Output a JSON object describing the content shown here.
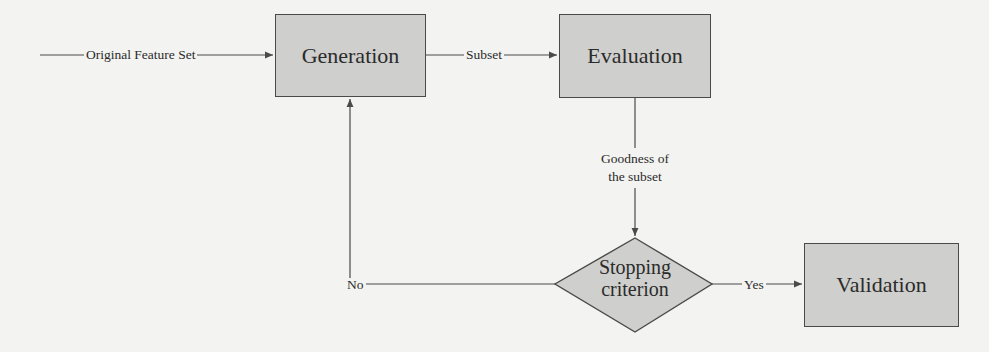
{
  "diagram": {
    "type": "flowchart",
    "nodes": [
      {
        "id": "generation",
        "label": "Generation",
        "shape": "rectangle"
      },
      {
        "id": "evaluation",
        "label": "Evaluation",
        "shape": "rectangle"
      },
      {
        "id": "stopping",
        "label_line1": "Stopping",
        "label_line2": "criterion",
        "shape": "diamond"
      },
      {
        "id": "validation",
        "label": "Validation",
        "shape": "rectangle"
      }
    ],
    "edges": [
      {
        "from": "input",
        "to": "generation",
        "label": "Original Feature Set"
      },
      {
        "from": "generation",
        "to": "evaluation",
        "label": "Subset"
      },
      {
        "from": "evaluation",
        "to": "stopping",
        "label_line1": "Goodness of",
        "label_line2": "the subset"
      },
      {
        "from": "stopping",
        "to": "generation",
        "label": "No"
      },
      {
        "from": "stopping",
        "to": "validation",
        "label": "Yes"
      }
    ]
  },
  "colors": {
    "background": "#f3f3f1",
    "node_fill": "#cfcfcd",
    "stroke": "#4a4a4a",
    "text": "#2b2b2b"
  }
}
